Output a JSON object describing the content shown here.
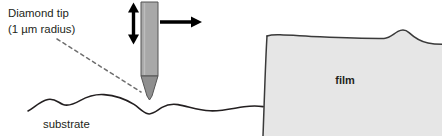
{
  "figure": {
    "type": "diagram",
    "width": 442,
    "height": 136,
    "background_color": "#ffffff"
  },
  "annotations": {
    "tip_label": {
      "line1": "Diamond tip",
      "line2": "(1 µm radius)",
      "x": 8,
      "y": 14,
      "color": "#231f20"
    },
    "substrate_label": {
      "text": "substrate",
      "x": 42,
      "y": 125,
      "color": "#231f20"
    },
    "film_label": {
      "text": "film",
      "x": 345,
      "y": 80,
      "color": "#000000"
    }
  },
  "elements": {
    "probe": {
      "name": "diamond-stylus-probe",
      "body_fill": "#a8a8a8",
      "body_stroke": "#4d4d4d",
      "tip_fill": "#8f8f8f",
      "left": 141,
      "right": 158,
      "top": 2,
      "shoulder_y": 76,
      "tip_point_y": 100
    },
    "vertical_arrow": {
      "name": "vertical-double-arrow",
      "color": "#000000",
      "x": 133,
      "y_top": 4,
      "y_bottom": 43
    },
    "horizontal_arrow": {
      "name": "horizontal-scan-arrow",
      "color": "#000000",
      "y": 22,
      "x_start": 160,
      "x_end": 201
    },
    "pointer_dashed_line": {
      "name": "dashed-pointer-line",
      "color": "#6e6e6e",
      "x_start": 57,
      "y_start": 39,
      "x_end": 142,
      "y_end": 93
    },
    "film_block": {
      "name": "film-block",
      "fill": "#e6e6e6",
      "stroke": "#3a3a3a",
      "left_edge_x": 267,
      "top_y": 35,
      "right_edge_x": 442,
      "bottom_y": 136,
      "bump_peak_x": 400,
      "bump_peak_y": 30
    },
    "substrate_curve": {
      "name": "substrate-surface-curve",
      "stroke": "#231f20",
      "stroke_width": 1.6
    }
  },
  "colors": {
    "ink": "#231f20",
    "probe_gray": "#a8a8a8",
    "film_gray": "#e6e6e6",
    "dash_gray": "#6e6e6e"
  }
}
